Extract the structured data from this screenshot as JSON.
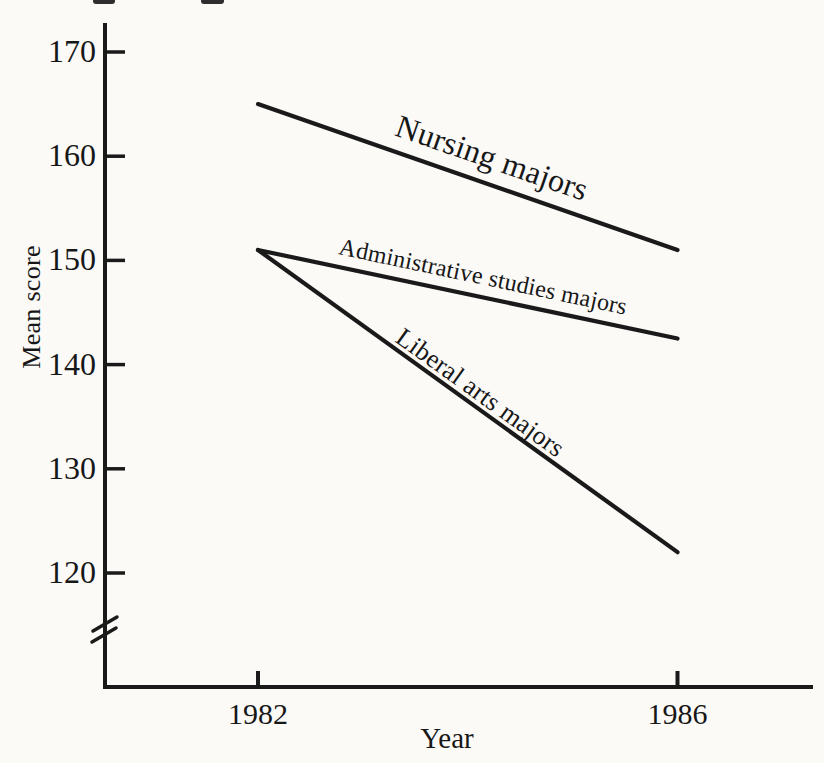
{
  "figure": {
    "background_color": "#fbfaf7",
    "ink_color": "#1a1a1a"
  },
  "chart_data": {
    "type": "line",
    "title": "",
    "xlabel": "Year",
    "ylabel": "Mean score",
    "x_values": [
      1982,
      1986
    ],
    "xtick_labels": [
      "1982",
      "1986"
    ],
    "ytick_values": [
      170,
      160,
      150,
      140,
      130,
      120
    ],
    "ytick_labels": [
      "170",
      "160",
      "150",
      "140",
      "130",
      "120"
    ],
    "ylim_shown": [
      120,
      170
    ],
    "y_axis_break": true,
    "grid": false,
    "legend_position": "inline labels along lines",
    "series": [
      {
        "name": "Nursing majors",
        "values": [
          165,
          151
        ]
      },
      {
        "name": "Administrative studies majors",
        "values": [
          151,
          142.5
        ]
      },
      {
        "name": "Liberal arts majors",
        "values": [
          151,
          122
        ]
      }
    ]
  }
}
